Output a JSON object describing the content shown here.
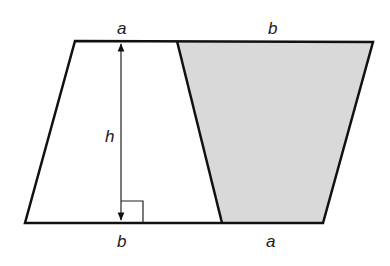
{
  "diagram": {
    "type": "parallelogram split into two congruent trapezoids",
    "colors": {
      "stroke": "#111111",
      "shaded_fill": "#d9d9d9",
      "background": "#ffffff"
    },
    "labels": {
      "top_left": "a",
      "top_right": "b",
      "height": "h",
      "bottom_left": "b",
      "bottom_right": "a"
    }
  }
}
